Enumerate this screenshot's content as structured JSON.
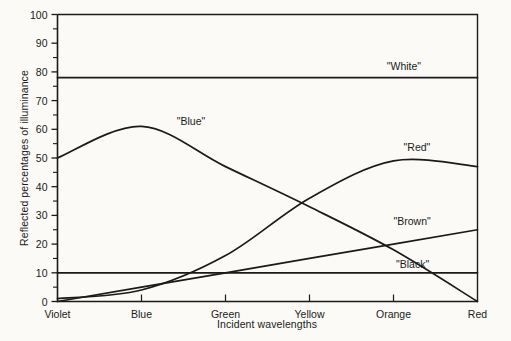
{
  "chart_data": {
    "type": "line",
    "title": "",
    "xlabel": "Incident wavelengths",
    "ylabel": "Reflected percentages of illuminance",
    "categories": [
      "Violet",
      "Blue",
      "Green",
      "Yellow",
      "Orange",
      "Red"
    ],
    "x": [
      0,
      1,
      2,
      3,
      4,
      5
    ],
    "ylim": [
      0,
      100
    ],
    "yticks": [
      0,
      10,
      20,
      30,
      40,
      50,
      60,
      70,
      80,
      90,
      100
    ],
    "ytick_labels": [
      "0",
      "10",
      "20",
      "30",
      "40",
      "50",
      "60",
      "70",
      "80",
      "90",
      "100"
    ],
    "grid": false,
    "legend": "inline-annotations",
    "line_color": "#1a1a1a",
    "background_color": "#fbfaf6",
    "series": [
      {
        "name": "\"White\"",
        "label": "\"White\"",
        "shape": "flat",
        "values": [
          78,
          78,
          78,
          78,
          78,
          78
        ],
        "label_x": 3.92,
        "label_y": 82
      },
      {
        "name": "\"Blue\"",
        "label": "\"Blue\"",
        "shape": "rise-then-fall",
        "values": [
          50,
          61,
          47,
          33,
          18,
          0
        ],
        "label_x": 1.42,
        "label_y": 63
      },
      {
        "name": "\"Red\"",
        "label": "\"Red\"",
        "shape": "slow-rise-plateau",
        "values": [
          1,
          4,
          16,
          36,
          49,
          47
        ],
        "label_x": 4.12,
        "label_y": 54
      },
      {
        "name": "\"Brown\"",
        "label": "\"Brown\"",
        "shape": "linear-rise",
        "values": [
          0,
          5,
          10,
          15,
          20,
          25
        ],
        "label_x": 4.0,
        "label_y": 28
      },
      {
        "name": "\"Black\"",
        "label": "\"Black\"",
        "shape": "flat",
        "values": [
          10,
          10,
          10,
          10,
          10,
          10
        ],
        "label_x": 4.03,
        "label_y": 13
      }
    ]
  }
}
